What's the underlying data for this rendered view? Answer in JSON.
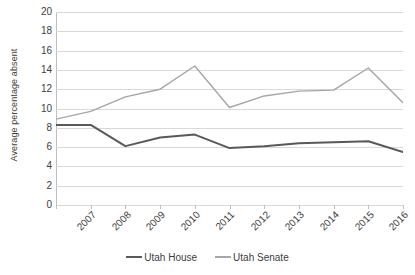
{
  "chart_data": {
    "type": "line",
    "title": "",
    "xlabel": "",
    "ylabel": "Average percentage absent",
    "categories": [
      "2007",
      "2008",
      "2009",
      "2010",
      "2011",
      "2012",
      "2013",
      "2014",
      "2015",
      "2016",
      "2017"
    ],
    "ylim": [
      0,
      20
    ],
    "yticks": [
      0,
      2,
      4,
      6,
      8,
      10,
      12,
      14,
      16,
      18,
      20
    ],
    "ytick_labels": [
      "0",
      "2",
      "4",
      "6",
      "8",
      "10",
      "12",
      "14",
      "16",
      "18",
      "20"
    ],
    "grid": true,
    "grid_axis": "y",
    "legend_position": "bottom",
    "series": [
      {
        "name": "Utah House",
        "color": "#595959",
        "values": [
          8.3,
          8.3,
          6.1,
          7.0,
          7.3,
          5.9,
          6.1,
          6.4,
          6.5,
          6.6,
          5.5
        ]
      },
      {
        "name": "Utah Senate",
        "color": "#a6a6a6",
        "values": [
          8.9,
          9.7,
          11.2,
          12.0,
          14.4,
          10.1,
          11.3,
          11.8,
          11.9,
          14.2,
          10.6
        ]
      }
    ]
  },
  "colors": {
    "gridline": "#d9d9d9",
    "axis": "#bfbfbf",
    "text": "#3d3d3d",
    "background": "#ffffff"
  }
}
